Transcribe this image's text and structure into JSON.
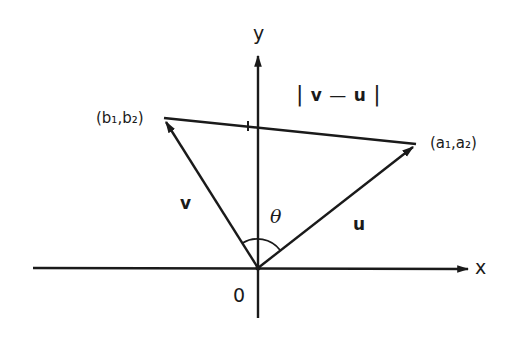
{
  "diagram": {
    "type": "vector-difference",
    "colors": {
      "stroke": "#1a1a1a",
      "background": "#ffffff"
    },
    "axes": {
      "x_label": "x",
      "y_label": "y",
      "origin_label": "0"
    },
    "points": {
      "a": {
        "label": "(a₁,a₂)"
      },
      "b": {
        "label": "(b₁,b₂)"
      }
    },
    "vectors": {
      "u": {
        "label": "u",
        "from": "origin",
        "to": "(a₁,a₂)"
      },
      "v": {
        "label": "v",
        "from": "origin",
        "to": "(b₁,b₂)"
      }
    },
    "segment": {
      "label_left_bar": "|",
      "label_v": "v",
      "label_minus": "—",
      "label_u": "u",
      "label_right_bar": "|",
      "label": "|v—u|"
    },
    "angle": {
      "label": "θ"
    }
  }
}
